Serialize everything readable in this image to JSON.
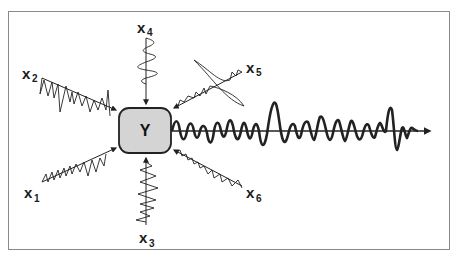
{
  "diagram": {
    "type": "multi-input signal aggregation",
    "output_node": {
      "label": "Y",
      "fill": "#d4d4d4",
      "stroke": "#222222"
    },
    "inputs": [
      {
        "id": "x1",
        "letter": "x",
        "sub": "1",
        "position": "lower-left"
      },
      {
        "id": "x2",
        "letter": "x",
        "sub": "2",
        "position": "upper-left"
      },
      {
        "id": "x3",
        "letter": "x",
        "sub": "3",
        "position": "bottom"
      },
      {
        "id": "x4",
        "letter": "x",
        "sub": "4",
        "position": "top"
      },
      {
        "id": "x5",
        "letter": "x",
        "sub": "5",
        "position": "upper-right"
      },
      {
        "id": "x6",
        "letter": "x",
        "sub": "6",
        "position": "lower-right"
      }
    ],
    "output_signal": {
      "description": "combined waveform along time axis",
      "direction": "right"
    },
    "colors": {
      "frame": "#8a8a8a",
      "line": "#222222",
      "node_fill": "#d4d4d4"
    }
  }
}
